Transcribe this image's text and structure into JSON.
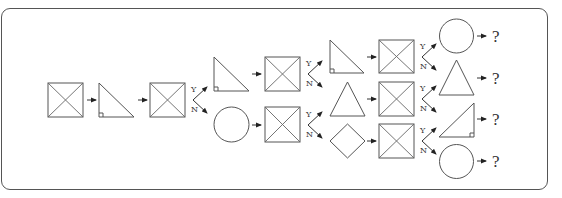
{
  "diagram": {
    "type": "decision-tree-sequence",
    "colors": {
      "stroke": "#555555",
      "background": "#ffffff"
    },
    "labels": {
      "yes": "Y",
      "no": "N",
      "unknown": "?"
    },
    "levels": [
      {
        "level": 0,
        "nodes": [
          "square-x",
          "right-triangle",
          "square-x"
        ]
      },
      {
        "level": 1,
        "nodes": [
          {
            "branch": "Y",
            "shape": "right-triangle",
            "then": "square-x"
          },
          {
            "branch": "N",
            "shape": "circle",
            "then": "square-x"
          }
        ]
      },
      {
        "level": 2,
        "nodes": [
          {
            "branch": "Y-Y",
            "shape": "right-triangle",
            "then": "square-x"
          },
          {
            "branch": "Y-N",
            "shape": "isosceles-triangle",
            "then": "square-x"
          },
          {
            "branch": "N-Y",
            "shape": "isosceles-triangle",
            "then": "square-x"
          },
          {
            "branch": "N-N",
            "shape": "diamond",
            "then": "square-x"
          }
        ]
      },
      {
        "level": 3,
        "nodes": [
          {
            "shape": "circle",
            "result": "?"
          },
          {
            "shape": "isosceles-triangle",
            "result": "?"
          },
          {
            "shape": "right-triangle-mirrored",
            "result": "?"
          },
          {
            "shape": "circle",
            "result": "?"
          }
        ]
      }
    ],
    "outputs": [
      "?",
      "?",
      "?",
      "?"
    ]
  }
}
